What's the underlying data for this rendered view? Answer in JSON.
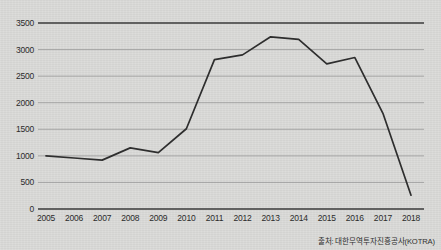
{
  "source_note": "출처: 대한무역투자진흥공사(KOTRA)",
  "axis": {
    "y_ticks": [
      "0",
      "500",
      "1000",
      "1500",
      "2000",
      "2500",
      "3000",
      "3500"
    ],
    "x_ticks": [
      "2005",
      "2006",
      "2007",
      "2008",
      "2009",
      "2010",
      "2011",
      "2012",
      "2013",
      "2014",
      "2015",
      "2016",
      "2017",
      "2018"
    ]
  },
  "colors": {
    "background": "#d9d9d7",
    "line": "#2e2e2e",
    "grid": "#8f8f8f",
    "axis": "#3a3a3a",
    "text": "#2b2b2b"
  },
  "chart_data": {
    "type": "line",
    "title": "",
    "xlabel": "",
    "ylabel": "",
    "categories": [
      "2005",
      "2006",
      "2007",
      "2008",
      "2009",
      "2010",
      "2011",
      "2012",
      "2013",
      "2014",
      "2015",
      "2016",
      "2017",
      "2018"
    ],
    "values": [
      1000,
      960,
      920,
      1150,
      1060,
      1510,
      2810,
      2900,
      3240,
      3190,
      2730,
      2850,
      1800,
      260
    ],
    "ylim": [
      0,
      3500
    ],
    "ytick_step": 500,
    "grid": true,
    "legend": "none",
    "series": [
      {
        "name": "",
        "values": [
          1000,
          960,
          920,
          1150,
          1060,
          1510,
          2810,
          2900,
          3240,
          3190,
          2730,
          2850,
          1800,
          260
        ]
      }
    ],
    "annotations": [
      "출처: 대한무역투자진흥공사(KOTRA)"
    ]
  }
}
